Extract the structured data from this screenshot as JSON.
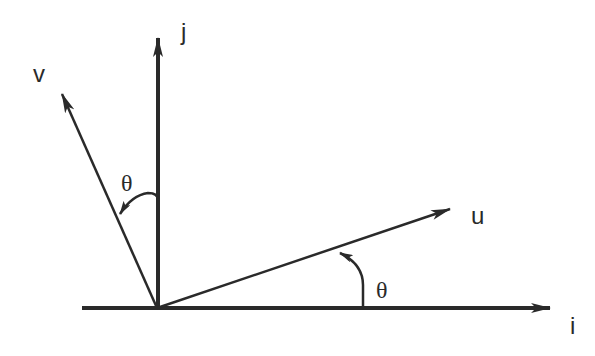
{
  "diagram": {
    "type": "vector-rotation",
    "colors": {
      "stroke": "#2a2a2a",
      "background": "#ffffff"
    },
    "origin": [
      157,
      308
    ],
    "axes": [
      {
        "id": "i",
        "label": "i",
        "tip": [
          550,
          308
        ]
      },
      {
        "id": "j",
        "label": "j",
        "tip": [
          158,
          38
        ]
      }
    ],
    "vectors": [
      {
        "id": "u",
        "label": "u",
        "tip": [
          450,
          209
        ]
      },
      {
        "id": "v",
        "label": "v",
        "tip": [
          62,
          94
        ]
      }
    ],
    "angles": [
      {
        "id": "theta-u",
        "label": "θ",
        "between": [
          "i",
          "u"
        ]
      },
      {
        "id": "theta-v",
        "label": "θ",
        "between": [
          "j",
          "v"
        ]
      }
    ]
  }
}
